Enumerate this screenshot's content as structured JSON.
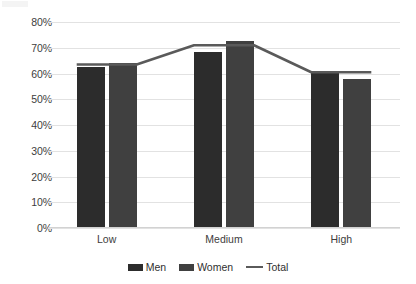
{
  "chart_data": {
    "type": "bar",
    "title": "",
    "subtitle": "",
    "xlabel": "",
    "ylabel": "",
    "categories": [
      "Low",
      "Medium",
      "High"
    ],
    "series": [
      {
        "name": "Men",
        "type": "bar",
        "color": "#2c2c2c",
        "values": [
          62.5,
          68.5,
          61.0
        ]
      },
      {
        "name": "Women",
        "type": "bar",
        "color": "#404040",
        "values": [
          64.0,
          72.5,
          58.0
        ]
      },
      {
        "name": "Total",
        "type": "line",
        "color": "#5a5a5a",
        "values": [
          63.5,
          71.0,
          60.5
        ]
      }
    ],
    "ylim": [
      0,
      80
    ],
    "ytick_values": [
      0,
      10,
      20,
      30,
      40,
      50,
      60,
      70,
      80
    ],
    "ytick_labels": [
      "0%",
      "10%",
      "20%",
      "30%",
      "40%",
      "50%",
      "60%",
      "70%",
      "80%"
    ],
    "grid": true,
    "grid_axis": "y",
    "legend": true,
    "legend_position": "bottom",
    "legend_entries": [
      {
        "label": "Men",
        "marker": "square",
        "color": "#2c2c2c"
      },
      {
        "label": "Women",
        "marker": "square",
        "color": "#404040"
      },
      {
        "label": "Total",
        "marker": "line",
        "color": "#5a5a5a"
      }
    ],
    "background_color": "#ffffff",
    "axis_label_color": "#3d3d3d"
  }
}
